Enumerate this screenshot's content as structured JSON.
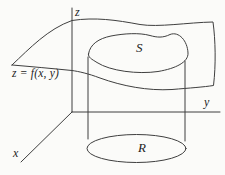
{
  "figure": {
    "type": "math-diagram",
    "description_of_pixels": "3D sketch of a surface above a plane region with a projecting cylinder",
    "colors": {
      "background": "#fbfbf9",
      "line": "#3f3f3f",
      "text": "#1d1d1d"
    },
    "axis_labels": {
      "x": "x",
      "y": "y",
      "z": "z"
    },
    "surface_equation_label": "z = f(x, y)",
    "surface_region_label": "S",
    "base_region_label": "R"
  }
}
